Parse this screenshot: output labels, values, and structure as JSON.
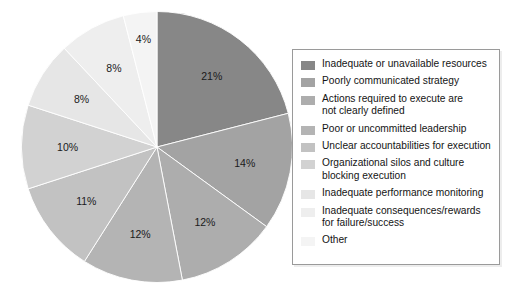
{
  "chart_data": {
    "type": "pie",
    "title": "",
    "subtitle": "",
    "xlabel": "",
    "ylabel": "",
    "legend_position": "right",
    "grid": false,
    "start_angle_deg": 0,
    "direction": "clockwise",
    "value_unit": "%",
    "categories": [
      "Inadequate or unavailable resources",
      "Poorly communicated strategy",
      "Actions required to execute are\nnot clearly defined",
      "Poor or uncommitted leadership",
      "Unclear accountabilities for execution",
      "Organizational silos and culture\nblocking execution",
      "Inadequate performance monitoring",
      "Inadequate consequences/rewards\nfor failure/success",
      "Other"
    ],
    "values": [
      21,
      14,
      12,
      12,
      11,
      10,
      8,
      8,
      4
    ],
    "data_labels": [
      "21%",
      "14%",
      "12%",
      "12%",
      "11%",
      "10%",
      "8%",
      "8%",
      "4%"
    ],
    "colors": [
      "#878787",
      "#a3a3a3",
      "#adadad",
      "#b4b4b4",
      "#c2c2c2",
      "#d2d2d2",
      "#e6e6e6",
      "#eeeeee",
      "#f4f4f4"
    ],
    "label_text_colors": [
      "#ffffff",
      "#1a1a1a",
      "#1a1a1a",
      "#1a1a1a",
      "#1a1a1a",
      "#1a1a1a",
      "#1a1a1a",
      "#1a1a1a",
      "#1a1a1a"
    ]
  },
  "legend": {
    "items": [
      {
        "label": "Inadequate or unavailable resources",
        "color": "#878787"
      },
      {
        "label": "Poorly communicated strategy",
        "color": "#a3a3a3"
      },
      {
        "label": "Actions required to execute are\nnot clearly defined",
        "color": "#adadad"
      },
      {
        "label": "Poor or uncommitted leadership",
        "color": "#b4b4b4"
      },
      {
        "label": "Unclear accountabilities for execution",
        "color": "#c2c2c2"
      },
      {
        "label": "Organizational silos and culture\nblocking execution",
        "color": "#d2d2d2"
      },
      {
        "label": "Inadequate performance monitoring",
        "color": "#e6e6e6"
      },
      {
        "label": "Inadequate consequences/rewards\nfor failure/success",
        "color": "#eeeeee"
      },
      {
        "label": "Other",
        "color": "#f4f4f4"
      }
    ]
  },
  "style": {
    "background": "#ffffff",
    "legend_border": "#9a9a9a",
    "slice_divider": "#ffffff"
  }
}
